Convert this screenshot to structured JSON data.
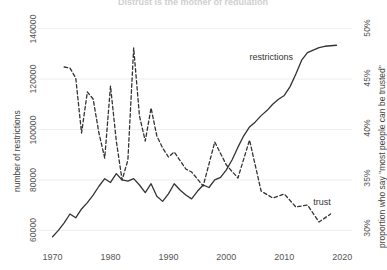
{
  "chart_data": {
    "type": "line",
    "title": "Distrust is the mother of regulation",
    "title_truncated": true,
    "xlabel": "",
    "xlim": [
      1968,
      2021
    ],
    "x_ticks": [
      1970,
      1980,
      1990,
      2000,
      2010,
      2020
    ],
    "grid": true,
    "grid_axis": "y",
    "legend": "inline-labels",
    "axes": [
      {
        "id": "left",
        "ylabel": "number of restrictions",
        "ylim": [
          55000,
          145000
        ],
        "y_ticks": [
          60000,
          80000,
          100000,
          120000,
          140000
        ],
        "y_tick_labels": [
          "60000",
          "80000",
          "100000",
          "120000",
          "140000"
        ]
      },
      {
        "id": "right",
        "ylabel": "proportion who say \"most people can be trusted\"",
        "ylim": [
          0.285,
          0.512
        ],
        "y_ticks": [
          0.3,
          0.35,
          0.4,
          0.45,
          0.5
        ],
        "y_tick_labels": [
          "30%",
          "35%",
          "40%",
          "45%",
          "50%"
        ]
      }
    ],
    "series": [
      {
        "name": "restrictions",
        "label": "restrictions",
        "axis": "left",
        "style": "solid",
        "color": "#333333",
        "label_x": 2004,
        "label_y": 128500,
        "x": [
          1970,
          1971,
          1972,
          1973,
          1974,
          1975,
          1976,
          1977,
          1978,
          1979,
          1980,
          1981,
          1982,
          1983,
          1984,
          1985,
          1986,
          1987,
          1988,
          1989,
          1990,
          1991,
          1992,
          1993,
          1994,
          1995,
          1996,
          1997,
          1998,
          1999,
          2000,
          2001,
          2002,
          2003,
          2004,
          2005,
          2006,
          2007,
          2008,
          2009,
          2010,
          2011,
          2012,
          2013,
          2014,
          2015,
          2016,
          2017,
          2018,
          2019
        ],
        "values": [
          57500,
          60000,
          63000,
          66500,
          65000,
          68500,
          71000,
          74000,
          77500,
          80500,
          79000,
          82500,
          80000,
          79500,
          80500,
          78000,
          75000,
          78500,
          73500,
          71500,
          74500,
          78500,
          76000,
          74000,
          72500,
          75500,
          78000,
          77000,
          80000,
          81000,
          84000,
          88000,
          93000,
          97500,
          101000,
          103000,
          105500,
          107500,
          110000,
          112000,
          113500,
          117000,
          122000,
          127500,
          130500,
          131500,
          132500,
          133000,
          133200,
          133400
        ]
      },
      {
        "name": "trust",
        "label": "trust",
        "axis": "right",
        "style": "dashed",
        "color": "#333333",
        "label_x": 2015,
        "label_y": 0.325,
        "x": [
          1972,
          1973,
          1974,
          1975,
          1976,
          1977,
          1978,
          1979,
          1980,
          1981,
          1982,
          1983,
          1984,
          1985,
          1986,
          1987,
          1988,
          1989,
          1990,
          1991,
          1993,
          1994,
          1996,
          1998,
          2000,
          2002,
          2004,
          2006,
          2008,
          2010,
          2012,
          2014,
          2016,
          2018
        ],
        "values": [
          0.461,
          0.46,
          0.45,
          0.395,
          0.436,
          0.429,
          0.395,
          0.37,
          0.442,
          0.387,
          0.348,
          0.368,
          0.48,
          0.412,
          0.387,
          0.42,
          0.392,
          0.38,
          0.371,
          0.376,
          0.359,
          0.356,
          0.342,
          0.386,
          0.363,
          0.35,
          0.388,
          0.337,
          0.33,
          0.334,
          0.321,
          0.323,
          0.306,
          0.314
        ]
      }
    ]
  }
}
